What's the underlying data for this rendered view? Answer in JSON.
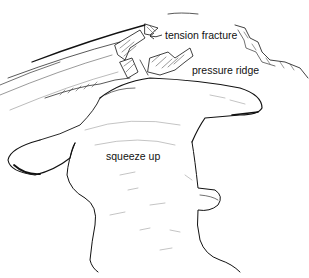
{
  "diagram": {
    "labels": {
      "tension_fracture": "tension fracture",
      "pressure_ridge": "pressure ridge",
      "squeeze_up": "squeeze up"
    },
    "colors": {
      "ink": "#111111",
      "background": "#ffffff"
    }
  }
}
